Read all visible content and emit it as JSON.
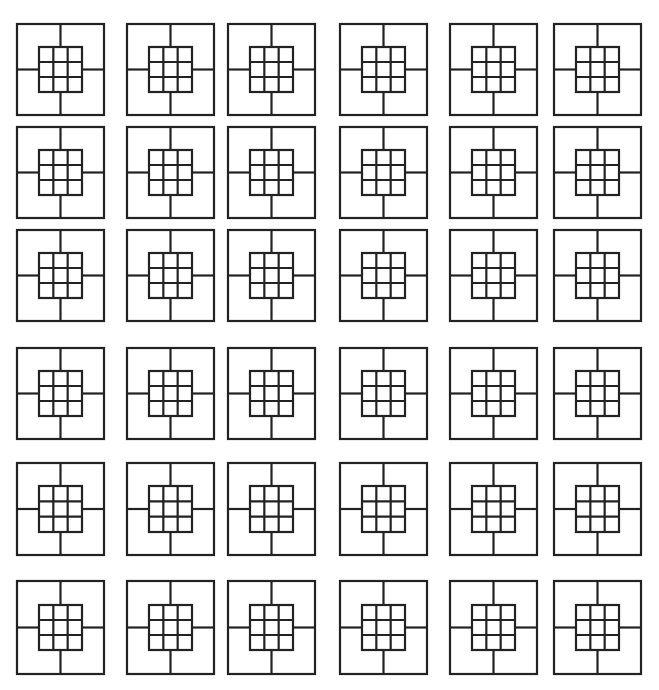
{
  "diagram": {
    "title": "",
    "stroke_color": "#222222",
    "background_color": "#ffffff",
    "rows": 6,
    "columns": 6,
    "column_left_px": [
      16,
      126,
      227,
      339,
      449,
      553
    ],
    "column_width_px": [
      89,
      89,
      89,
      89,
      89,
      89
    ],
    "row_top_px": [
      23,
      126,
      229,
      347,
      462,
      580
    ],
    "row_height_px": [
      93,
      93,
      93,
      93,
      94,
      95
    ],
    "tile": {
      "shape": "outer-square-with-inner-3x3-grid",
      "inner_grid_cells": 9,
      "connectors": [
        "top",
        "bottom",
        "left",
        "right"
      ]
    }
  }
}
